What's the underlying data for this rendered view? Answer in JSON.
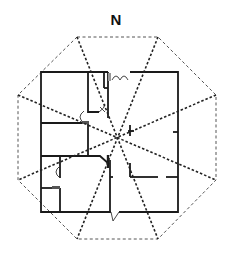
{
  "diagram": {
    "type": "bagua-floor-plan",
    "north_label": "N",
    "colors": {
      "octagon": "#555555",
      "sector_lines": "#222222",
      "walls": "#1a1a1a",
      "door_fill": "#999999"
    },
    "center": [
      117,
      137
    ],
    "octagon_vertices": [
      [
        77,
        37
      ],
      [
        158,
        37
      ],
      [
        216,
        95
      ],
      [
        216,
        180
      ],
      [
        158,
        239
      ],
      [
        77,
        239
      ],
      [
        18,
        180
      ],
      [
        18,
        95
      ]
    ],
    "house_outline": {
      "x": 41,
      "y": 72,
      "width": 137,
      "height": 140
    },
    "sector_count": 8
  }
}
